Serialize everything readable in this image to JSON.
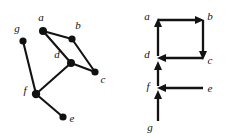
{
  "figure": {
    "background_color": "#ffffff",
    "ink_color": "#131313",
    "width": 227,
    "height": 137
  },
  "panels": [
    {
      "id": "left-panel",
      "name": "undirected-graph",
      "kind": "undirected",
      "nodes": [
        {
          "id": "a",
          "label": "a",
          "x": 43,
          "y": 31,
          "label_x": 41,
          "label_y": 21,
          "radius": 4.0
        },
        {
          "id": "b",
          "label": "b",
          "x": 72,
          "y": 39,
          "label_x": 78,
          "label_y": 29,
          "radius": 3.6
        },
        {
          "id": "c",
          "label": "c",
          "x": 95,
          "y": 72,
          "label_x": 103,
          "label_y": 83,
          "radius": 3.6
        },
        {
          "id": "d",
          "label": "d",
          "x": 71,
          "y": 63,
          "label_x": 57,
          "label_y": 58,
          "radius": 4.0
        },
        {
          "id": "e",
          "label": "e",
          "x": 63,
          "y": 117,
          "label_x": 72,
          "label_y": 122,
          "radius": 3.6
        },
        {
          "id": "f",
          "label": "f",
          "x": 36,
          "y": 94,
          "label_x": 25,
          "label_y": 94,
          "radius": 4.2
        },
        {
          "id": "g",
          "label": "g",
          "x": 23,
          "y": 41,
          "label_x": 17,
          "label_y": 32,
          "radius": 3.6
        }
      ],
      "edges": [
        {
          "from": "a",
          "to": "b"
        },
        {
          "from": "a",
          "to": "d"
        },
        {
          "from": "b",
          "to": "c"
        },
        {
          "from": "d",
          "to": "c"
        },
        {
          "from": "d",
          "to": "f"
        },
        {
          "from": "g",
          "to": "f"
        },
        {
          "from": "f",
          "to": "e"
        }
      ]
    },
    {
      "id": "right-panel",
      "name": "directed-graph",
      "kind": "directed",
      "nodes": [
        {
          "id": "a",
          "label": "a",
          "x": 158,
          "y": 20,
          "label_x": 147,
          "label_y": 19
        },
        {
          "id": "b",
          "label": "b",
          "x": 203,
          "y": 20,
          "label_x": 208,
          "label_y": 19
        },
        {
          "id": "c",
          "label": "c",
          "x": 203,
          "y": 58,
          "label_x": 208,
          "label_y": 63
        },
        {
          "id": "d",
          "label": "d",
          "x": 158,
          "y": 58,
          "label_x": 147,
          "label_y": 57
        },
        {
          "id": "e",
          "label": "e",
          "x": 205,
          "y": 88,
          "label_x": 207,
          "label_y": 92
        },
        {
          "id": "f",
          "label": "f",
          "x": 158,
          "y": 88,
          "label_x": 148,
          "label_y": 88
        },
        {
          "id": "g",
          "label": "g",
          "x": 158,
          "y": 120,
          "label_x": 149,
          "label_y": 128
        }
      ],
      "edges": [
        {
          "from": "d",
          "to": "a",
          "direction": "up",
          "arrow_at": "a"
        },
        {
          "from": "a",
          "to": "b",
          "direction": "right",
          "arrow_at": "b"
        },
        {
          "from": "b",
          "to": "c",
          "direction": "down",
          "arrow_at": "c"
        },
        {
          "from": "c",
          "to": "d",
          "direction": "left",
          "arrow_at": "d"
        },
        {
          "from": "f",
          "to": "d",
          "direction": "up",
          "arrow_at": "d"
        },
        {
          "from": "e",
          "to": "f",
          "direction": "left",
          "arrow_at": "f"
        },
        {
          "from": "g",
          "to": "f",
          "direction": "up",
          "arrow_at": "f"
        }
      ]
    }
  ],
  "labels": {
    "a": "a",
    "b": "b",
    "c": "c",
    "d": "d",
    "e": "e",
    "f": "f",
    "g": "g"
  }
}
